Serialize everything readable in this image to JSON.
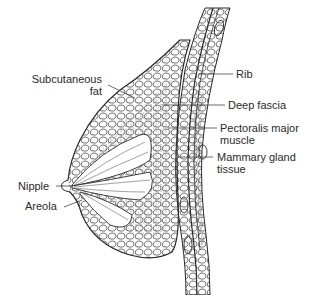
{
  "diagram": {
    "labels": {
      "subcutaneous_fat_line1": "Subcutaneous",
      "subcutaneous_fat_line2": "fat",
      "rib": "Rib",
      "deep_fascia": "Deep fascia",
      "pectoralis_line1": "Pectoralis major",
      "pectoralis_line2": "muscle",
      "mammary_line1": "Mammary gland",
      "mammary_line2": "tissue",
      "nipple": "Nipple",
      "areola": "Areola"
    },
    "colors": {
      "ink": "#2a2a2a",
      "background": "#ffffff"
    }
  }
}
